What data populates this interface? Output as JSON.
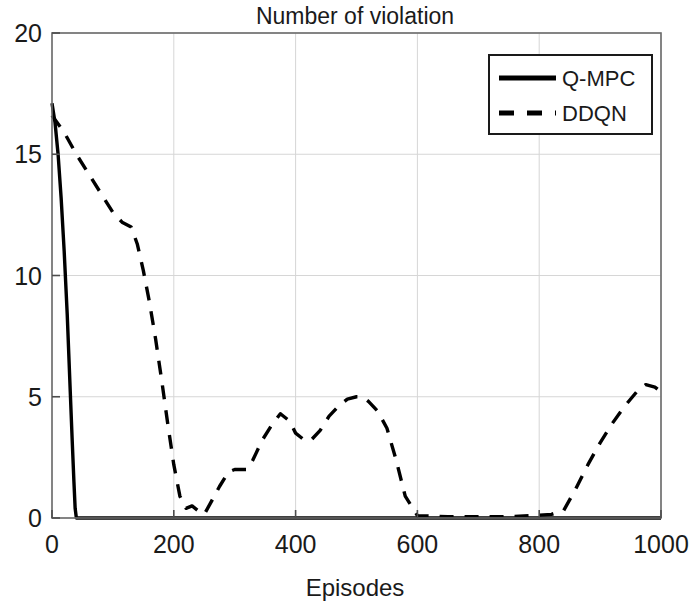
{
  "chart_data": {
    "type": "line",
    "title": "Number of violation",
    "xlabel": "Episodes",
    "ylabel": "",
    "xlim": [
      0,
      1000
    ],
    "ylim": [
      0,
      20
    ],
    "xticks": [
      0,
      200,
      400,
      600,
      800,
      1000
    ],
    "yticks": [
      0,
      5,
      10,
      15,
      20
    ],
    "grid": true,
    "legend_position": "upper right",
    "series": [
      {
        "name": "Q-MPC",
        "style": "solid",
        "color": "#000000",
        "linewidth": 3.4,
        "x": [
          0,
          5,
          10,
          15,
          20,
          25,
          30,
          33,
          36,
          38,
          40,
          60,
          100,
          150,
          200,
          250,
          300,
          350,
          400,
          450,
          500,
          550,
          600,
          650,
          700,
          750,
          800,
          850,
          900,
          950,
          1000
        ],
        "y": [
          17.1,
          16.3,
          15.0,
          13.2,
          11.0,
          8.4,
          5.2,
          3.3,
          1.5,
          0.4,
          0.0,
          0.0,
          0.0,
          0.0,
          0.0,
          0.0,
          0.0,
          0.0,
          0.0,
          0.0,
          0.0,
          0.0,
          0.0,
          0.0,
          0.0,
          0.0,
          0.0,
          0.0,
          0.0,
          0.0,
          0.0
        ]
      },
      {
        "name": "DDQN",
        "style": "dashed",
        "color": "#000000",
        "linewidth": 3.4,
        "dash": "14,11",
        "x": [
          0,
          20,
          40,
          60,
          80,
          100,
          115,
          130,
          140,
          150,
          160,
          170,
          180,
          190,
          200,
          210,
          220,
          230,
          240,
          250,
          260,
          275,
          290,
          300,
          310,
          320,
          330,
          345,
          360,
          375,
          390,
          400,
          415,
          425,
          440,
          455,
          470,
          485,
          500,
          510,
          520,
          535,
          550,
          565,
          580,
          600,
          650,
          700,
          750,
          790,
          820,
          840,
          860,
          880,
          900,
          920,
          940,
          960,
          975,
          990,
          1000
        ],
        "y": [
          16.6,
          15.9,
          15.0,
          14.2,
          13.4,
          12.6,
          12.2,
          12.0,
          11.3,
          10.2,
          8.9,
          7.4,
          5.7,
          3.9,
          2.2,
          0.9,
          0.4,
          0.5,
          0.3,
          0.15,
          0.6,
          1.3,
          1.9,
          2.0,
          2.0,
          2.0,
          2.4,
          3.2,
          3.8,
          4.3,
          4.0,
          3.5,
          3.2,
          3.2,
          3.6,
          4.2,
          4.6,
          4.9,
          5.0,
          5.0,
          4.8,
          4.4,
          3.7,
          2.4,
          0.9,
          0.1,
          0.05,
          0.05,
          0.05,
          0.1,
          0.15,
          0.3,
          1.2,
          2.2,
          3.1,
          3.9,
          4.6,
          5.2,
          5.5,
          5.4,
          5.2
        ]
      }
    ]
  },
  "legend": {
    "items": [
      {
        "label": "Q-MPC",
        "style": "solid"
      },
      {
        "label": "DDQN",
        "style": "dashed"
      }
    ]
  },
  "axes": {
    "title": "Number of violation",
    "xlabel": "Episodes",
    "xtick_labels": [
      "0",
      "200",
      "400",
      "600",
      "800",
      "1000"
    ],
    "ytick_labels": [
      "0",
      "5",
      "10",
      "15",
      "20"
    ]
  },
  "colors": {
    "line": "#000000",
    "grid": "#d6d6d6",
    "frame": "#6b6b6b",
    "background": "#ffffff",
    "text": "#1a1a1a"
  }
}
